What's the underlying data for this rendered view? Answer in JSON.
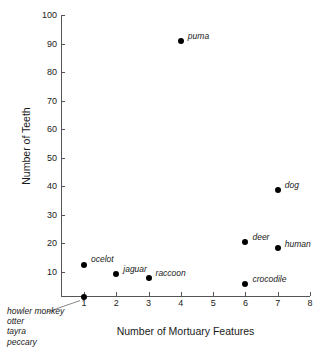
{
  "chart_data": {
    "type": "scatter",
    "title": "",
    "xlabel": "Number of Mortuary Features",
    "ylabel": "Number of Teeth",
    "xlim": [
      0.3,
      8.3
    ],
    "ylim": [
      0,
      100
    ],
    "xticks": [
      1,
      2,
      3,
      4,
      5,
      6,
      7,
      8
    ],
    "yticks": [
      10,
      20,
      30,
      40,
      50,
      60,
      70,
      80,
      90,
      100
    ],
    "xtick_labels": [
      "1",
      "2",
      "3",
      "4",
      "5",
      "6",
      "7",
      "8"
    ],
    "ytick_labels": [
      "10",
      "20",
      "30",
      "40",
      "50",
      "60",
      "70",
      "80",
      "90",
      "100"
    ],
    "grid": false,
    "legend": null,
    "marker": "filled-circle",
    "marker_color": "#000000",
    "points": [
      {
        "label": "puma",
        "x": 4,
        "y": 91,
        "label_dx": 7,
        "label_dy": -9
      },
      {
        "label": "dog",
        "x": 7,
        "y": 38.7,
        "label_dx": 7,
        "label_dy": -9
      },
      {
        "label": "deer",
        "x": 6,
        "y": 20.6,
        "label_dx": 7,
        "label_dy": -9
      },
      {
        "label": "human",
        "x": 7,
        "y": 18.3,
        "label_dx": 7,
        "label_dy": -8
      },
      {
        "label": "ocelot",
        "x": 1,
        "y": 12.6,
        "label_dx": 7,
        "label_dy": -10
      },
      {
        "label": "jaguar",
        "x": 2,
        "y": 9.4,
        "label_dx": 7,
        "label_dy": -9
      },
      {
        "label": "raccoon",
        "x": 3,
        "y": 7.9,
        "label_dx": 7,
        "label_dy": -9
      },
      {
        "label": "crocodile",
        "x": 6,
        "y": 5.8,
        "label_dx": 7,
        "label_dy": -9
      },
      {
        "label": "",
        "x": 1,
        "y": 1.4,
        "label_dx": 0,
        "label_dy": 0
      }
    ],
    "annotations": [
      {
        "name": "origin-species-list",
        "lines": [
          "howler monkey",
          "otter",
          "tayra",
          "peccary"
        ],
        "points_to": {
          "x": 1,
          "y": 1.4
        }
      }
    ]
  }
}
